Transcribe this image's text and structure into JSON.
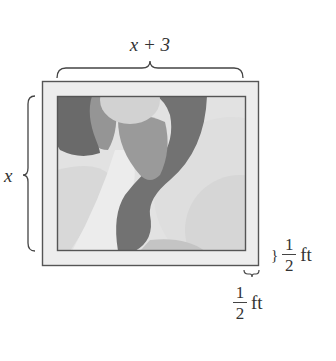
{
  "figure": {
    "type": "framed-picture-dimension-diagram",
    "top_dimension": {
      "label": "x + 3"
    },
    "left_dimension": {
      "label": "x"
    },
    "frame_width_right": {
      "numerator": "1",
      "denominator": "2",
      "unit": "ft",
      "brace": "}"
    },
    "frame_width_bottom": {
      "numerator": "1",
      "denominator": "2",
      "unit": "ft"
    },
    "colors": {
      "frame_fill": "#ededed",
      "frame_stroke": "#555555",
      "picture_bg": "#e4e4e4",
      "dark": "#6f6f6f",
      "medium_dark": "#8e8e8e",
      "medium": "#a7a7a7",
      "light": "#cfcfcf",
      "lighter": "#dadada",
      "lightest": "#ececec"
    }
  }
}
